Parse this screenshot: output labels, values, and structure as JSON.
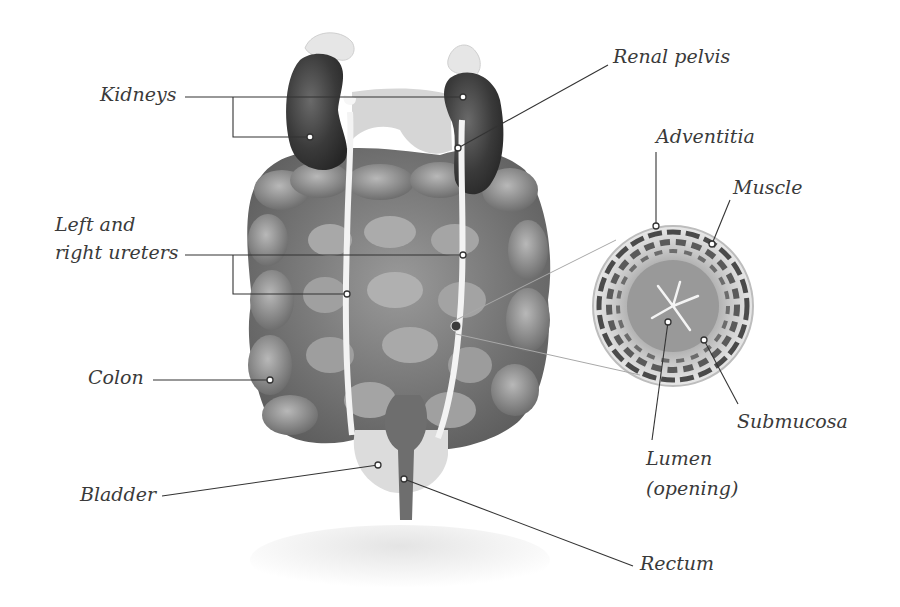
{
  "diagram": {
    "type": "anatomical-illustration",
    "labels": {
      "kidneys": "Kidneys",
      "renal_pelvis": "Renal pelvis",
      "ureters_line1": "Left and",
      "ureters_line2": "right ureters",
      "colon": "Colon",
      "bladder": "Bladder",
      "rectum": "Rectum",
      "adventitia": "Adventitia",
      "muscle": "Muscle",
      "submucosa": "Submucosa",
      "lumen_line1": "Lumen",
      "lumen_line2": "(opening)"
    },
    "colors": {
      "organ_dark": "#3c3c3c",
      "organ_mid": "#7a7a7a",
      "organ_light": "#b5b5b5",
      "ureter": "#f2f2f2",
      "leader_line": "#333333",
      "label_text": "#3a3a3a"
    }
  }
}
